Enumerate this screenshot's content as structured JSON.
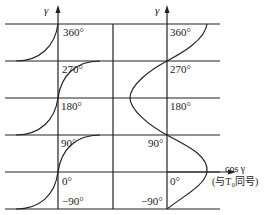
{
  "left_plot": {
    "axis_label": "γ",
    "ticks": [
      "360°",
      "270°",
      "180°",
      "90°",
      "0°",
      "−90°"
    ]
  },
  "right_plot": {
    "axis_label": "γ",
    "ticks": [
      "360°",
      "270°",
      "180°",
      "90°",
      "0°",
      "−90°"
    ],
    "x_axis_label": "cos γ",
    "x_axis_note": "(与T₀同号)"
  },
  "colors": {
    "line": "#222222",
    "background": "#ffffff"
  }
}
